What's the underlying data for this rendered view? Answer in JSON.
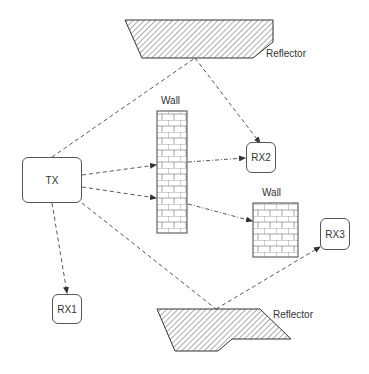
{
  "diagram": {
    "nodes": {
      "tx": {
        "label": "TX"
      },
      "rx1": {
        "label": "RX1"
      },
      "rx2": {
        "label": "RX2"
      },
      "rx3": {
        "label": "RX3"
      }
    },
    "obstacles": {
      "wall1": {
        "label": "Wall"
      },
      "wall2": {
        "label": "Wall"
      },
      "reflector_top": {
        "label": "Reflector"
      },
      "reflector_bottom": {
        "label": "Reflector"
      }
    },
    "edges": [
      {
        "from": "TX",
        "to": "Reflector (top)",
        "style": "dashed"
      },
      {
        "from": "Reflector (top)",
        "to": "RX2",
        "style": "dashed",
        "arrow": true
      },
      {
        "from": "TX",
        "to": "Wall",
        "style": "dashed",
        "arrow": true
      },
      {
        "from": "TX",
        "to": "Wall",
        "style": "dashed",
        "arrow": true
      },
      {
        "from": "Wall",
        "to": "RX2",
        "style": "dash-dot",
        "arrow": true
      },
      {
        "from": "Wall",
        "to": "Wall (small)",
        "style": "dash-dot",
        "arrow": true
      },
      {
        "from": "TX",
        "to": "RX1",
        "style": "dashed",
        "arrow": true
      },
      {
        "from": "TX",
        "to": "Reflector (bottom)",
        "style": "dashed"
      },
      {
        "from": "Reflector (bottom)",
        "to": "RX3",
        "style": "dashed",
        "arrow": true
      }
    ]
  }
}
